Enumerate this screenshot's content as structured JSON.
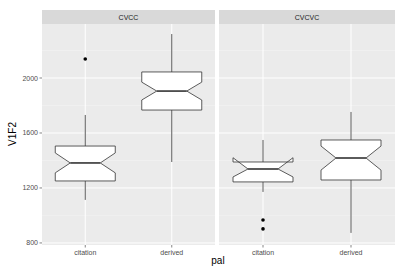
{
  "chart_data": {
    "type": "boxplot",
    "variant": "notched",
    "facet_var": "syllable structure",
    "facets": [
      "CVCC",
      "CVCVC"
    ],
    "categories": [
      "citation",
      "derived"
    ],
    "xlabel": "pal",
    "ylabel": "V1F2",
    "yticks": [
      800,
      1200,
      1600,
      2000
    ],
    "ylim": [
      785,
      2393
    ],
    "grid": true,
    "legend": null,
    "series": [
      {
        "facet": "CVCC",
        "boxes": [
          {
            "category": "citation",
            "whisker_low": 1113,
            "q1": 1251,
            "median": 1382,
            "q3": 1505,
            "whisker_high": 1731,
            "notch_low": 1310,
            "notch_high": 1455,
            "outliers": [
              2138
            ]
          },
          {
            "category": "derived",
            "whisker_low": 1389,
            "q1": 1767,
            "median": 1905,
            "q3": 2044,
            "whisker_high": 2320,
            "notch_low": 1840,
            "notch_high": 1970,
            "outliers": []
          }
        ]
      },
      {
        "facet": "CVCVC",
        "boxes": [
          {
            "category": "citation",
            "whisker_low": 1171,
            "q1": 1244,
            "median": 1338,
            "q3": 1389,
            "whisker_high": 1549,
            "notch_low": 1280,
            "notch_high": 1420,
            "outliers": [
              967,
              902
            ]
          },
          {
            "category": "derived",
            "whisker_low": 873,
            "q1": 1258,
            "median": 1418,
            "q3": 1549,
            "whisker_high": 1753,
            "notch_low": 1330,
            "notch_high": 1505,
            "outliers": []
          }
        ]
      }
    ]
  },
  "colors": {
    "panel_bg": "#ebebeb",
    "grid_major": "#ffffff",
    "strip_bg": "#d9d9d9",
    "box_fill": "#ffffff",
    "box_line": "#333333",
    "outlier": "#000000"
  }
}
